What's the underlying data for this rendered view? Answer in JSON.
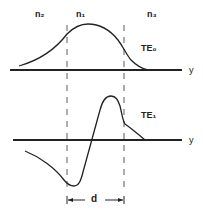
{
  "regions": [
    {
      "id": "n2",
      "label": "n₂"
    },
    {
      "id": "n1",
      "label": "n₁"
    },
    {
      "id": "n3",
      "label": "n₃"
    }
  ],
  "modes": [
    {
      "id": "te0",
      "label": "TE₀"
    },
    {
      "id": "te1",
      "label": "TE₁"
    }
  ],
  "axes": {
    "top_axis_label": "y",
    "bottom_axis_label": "y"
  },
  "dimension": {
    "label": "d"
  },
  "colors": {
    "stroke": "#222222",
    "background": "#ffffff"
  }
}
